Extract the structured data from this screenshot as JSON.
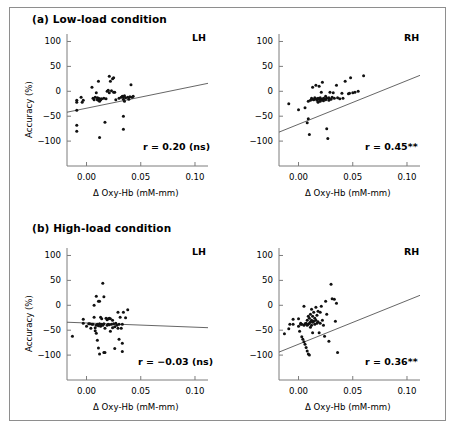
{
  "figure": {
    "background": "#ffffff",
    "border_color": "#8e8e8e",
    "panels": [
      {
        "key": "a",
        "title": "(a) Low-load condition",
        "subplots": [
          {
            "key": "a-lh",
            "hemisphere": "LH",
            "r_label": "r = 0.20 (ns)"
          },
          {
            "key": "a-rh",
            "hemisphere": "RH",
            "r_label": "r = 0.45**"
          }
        ]
      },
      {
        "key": "b",
        "title": "(b) High-load condition",
        "subplots": [
          {
            "key": "b-lh",
            "hemisphere": "LH",
            "r_label": "r = −0.03 (ns)"
          },
          {
            "key": "b-rh",
            "hemisphere": "RH",
            "r_label": "r = 0.36**"
          }
        ]
      }
    ]
  },
  "axes": {
    "xlabel": "Δ Oxy-Hb (mM-mm)",
    "ylabel": "Accuracy (%)",
    "xticks": [
      "0.00",
      "0.05",
      "0.10"
    ],
    "xtick_values": [
      0.0,
      0.05,
      0.1
    ],
    "yticks": [
      "100",
      "50",
      "0",
      "−50",
      "−100"
    ],
    "ytick_values": [
      100,
      50,
      0,
      -50,
      -100
    ],
    "xlim": [
      -0.018,
      0.112
    ],
    "ylim": [
      -150,
      115
    ],
    "marker_color": "#111111",
    "line_color": "#555555",
    "axis_color": "#7d7d7d"
  },
  "chart_data": [
    {
      "type": "scatter",
      "id": "a-lh",
      "title": "(a) Low-load condition — LH",
      "xlabel": "Δ Oxy-Hb (mM-mm)",
      "ylabel": "Accuracy (%)",
      "xlim": [
        -0.018,
        0.112
      ],
      "ylim": [
        -150,
        115
      ],
      "grid": false,
      "annotation": "r = 0.20 (ns)",
      "correlation": 0.2,
      "significance": "ns",
      "fit_line": {
        "x": [
          -0.018,
          0.112
        ],
        "y": [
          -42,
          16
        ]
      },
      "points": [
        [
          -0.009,
          -22
        ],
        [
          -0.009,
          -18
        ],
        [
          -0.009,
          -38
        ],
        [
          -0.009,
          -68
        ],
        [
          -0.009,
          -80
        ],
        [
          -0.005,
          -12
        ],
        [
          -0.004,
          -22
        ],
        [
          -0.003,
          -18
        ],
        [
          0.005,
          8
        ],
        [
          0.006,
          -14
        ],
        [
          0.007,
          -17
        ],
        [
          0.008,
          -12
        ],
        [
          0.009,
          -3
        ],
        [
          0.01,
          -13
        ],
        [
          0.01,
          -17
        ],
        [
          0.011,
          -14
        ],
        [
          0.011,
          -18
        ],
        [
          0.012,
          -15
        ],
        [
          0.012,
          -20
        ],
        [
          0.013,
          -16
        ],
        [
          0.011,
          20
        ],
        [
          0.012,
          -93
        ],
        [
          0.013,
          -17
        ],
        [
          0.014,
          -15
        ],
        [
          0.016,
          -14
        ],
        [
          0.017,
          -62
        ],
        [
          0.018,
          -15
        ],
        [
          0.019,
          0
        ],
        [
          0.02,
          2
        ],
        [
          0.021,
          30
        ],
        [
          0.021,
          -3
        ],
        [
          0.022,
          20
        ],
        [
          0.023,
          1
        ],
        [
          0.024,
          25
        ],
        [
          0.025,
          -2
        ],
        [
          0.025,
          27
        ],
        [
          0.026,
          -2
        ],
        [
          0.027,
          -17
        ],
        [
          0.03,
          -14
        ],
        [
          0.032,
          -12
        ],
        [
          0.033,
          -10
        ],
        [
          0.034,
          -11
        ],
        [
          0.034,
          -16
        ],
        [
          0.034,
          -50
        ],
        [
          0.034,
          -76
        ],
        [
          0.035,
          -9
        ],
        [
          0.035,
          -20
        ],
        [
          0.036,
          -13
        ],
        [
          0.038,
          -12
        ],
        [
          0.039,
          -16
        ],
        [
          0.04,
          -11
        ],
        [
          0.041,
          13
        ],
        [
          0.042,
          -12
        ],
        [
          0.043,
          -10
        ]
      ]
    },
    {
      "type": "scatter",
      "id": "a-rh",
      "title": "(a) Low-load condition — RH",
      "xlabel": "Δ Oxy-Hb (mM-mm)",
      "ylabel": "Accuracy (%)",
      "xlim": [
        -0.018,
        0.112
      ],
      "ylim": [
        -150,
        115
      ],
      "grid": false,
      "annotation": "r = 0.45**",
      "correlation": 0.45,
      "significance": "**",
      "fit_line": {
        "x": [
          -0.018,
          0.112
        ],
        "y": [
          -82,
          32
        ]
      },
      "points": [
        [
          -0.009,
          -25
        ],
        [
          0.0,
          -37
        ],
        [
          0.006,
          -33
        ],
        [
          0.008,
          -63
        ],
        [
          0.009,
          -55
        ],
        [
          0.009,
          -20
        ],
        [
          0.01,
          -87
        ],
        [
          0.011,
          -18
        ],
        [
          0.012,
          -14
        ],
        [
          0.013,
          8
        ],
        [
          0.013,
          -16
        ],
        [
          0.014,
          -17
        ],
        [
          0.015,
          -13
        ],
        [
          0.016,
          -15
        ],
        [
          0.016,
          12
        ],
        [
          0.017,
          -18
        ],
        [
          0.018,
          -14
        ],
        [
          0.018,
          -22
        ],
        [
          0.019,
          -16
        ],
        [
          0.019,
          10
        ],
        [
          0.02,
          -13
        ],
        [
          0.02,
          -20
        ],
        [
          0.021,
          -16
        ],
        [
          0.021,
          -2
        ],
        [
          0.022,
          -17
        ],
        [
          0.022,
          18
        ],
        [
          0.023,
          -14
        ],
        [
          0.023,
          -19
        ],
        [
          0.024,
          -15
        ],
        [
          0.025,
          -10
        ],
        [
          0.025,
          -17
        ],
        [
          0.026,
          -75
        ],
        [
          0.026,
          -14
        ],
        [
          0.027,
          -95
        ],
        [
          0.028,
          -13
        ],
        [
          0.028,
          -18
        ],
        [
          0.029,
          -2
        ],
        [
          0.03,
          -16
        ],
        [
          0.031,
          -12
        ],
        [
          0.032,
          -3
        ],
        [
          0.033,
          -14
        ],
        [
          0.035,
          12
        ],
        [
          0.036,
          -13
        ],
        [
          0.038,
          -15
        ],
        [
          0.04,
          -4
        ],
        [
          0.041,
          -14
        ],
        [
          0.043,
          20
        ],
        [
          0.046,
          -5
        ],
        [
          0.047,
          -4
        ],
        [
          0.048,
          27
        ],
        [
          0.05,
          -3
        ],
        [
          0.052,
          -2
        ],
        [
          0.055,
          0
        ],
        [
          0.06,
          31
        ]
      ]
    },
    {
      "type": "scatter",
      "id": "b-lh",
      "title": "(b) High-load condition — LH",
      "xlabel": "Δ Oxy-Hb (mM-mm)",
      "ylabel": "Accuracy (%)",
      "xlim": [
        -0.018,
        0.112
      ],
      "ylim": [
        -150,
        115
      ],
      "grid": false,
      "annotation": "r = −0.03 (ns)",
      "correlation": -0.03,
      "significance": "ns",
      "fit_line": {
        "x": [
          -0.018,
          0.112
        ],
        "y": [
          -34,
          -45
        ]
      },
      "points": [
        [
          -0.013,
          -62
        ],
        [
          -0.003,
          -36
        ],
        [
          -0.003,
          -28
        ],
        [
          0.0,
          -42
        ],
        [
          0.002,
          -37
        ],
        [
          0.003,
          -37
        ],
        [
          0.004,
          -46
        ],
        [
          0.005,
          -38
        ],
        [
          0.006,
          -38
        ],
        [
          0.007,
          -24
        ],
        [
          0.007,
          0
        ],
        [
          0.008,
          -45
        ],
        [
          0.008,
          -51
        ],
        [
          0.009,
          18
        ],
        [
          0.009,
          -40
        ],
        [
          0.009,
          -56
        ],
        [
          0.01,
          -38
        ],
        [
          0.01,
          -70
        ],
        [
          0.011,
          8
        ],
        [
          0.011,
          -41
        ],
        [
          0.011,
          -86
        ],
        [
          0.012,
          8
        ],
        [
          0.012,
          -37
        ],
        [
          0.012,
          -98
        ],
        [
          0.013,
          -24
        ],
        [
          0.013,
          -42
        ],
        [
          0.014,
          -27
        ],
        [
          0.014,
          -38
        ],
        [
          0.015,
          44
        ],
        [
          0.015,
          -40
        ],
        [
          0.016,
          17
        ],
        [
          0.016,
          -37
        ],
        [
          0.016,
          -95
        ],
        [
          0.017,
          -46
        ],
        [
          0.017,
          -95
        ],
        [
          0.018,
          -26
        ],
        [
          0.019,
          -29
        ],
        [
          0.019,
          -40
        ],
        [
          0.02,
          -27
        ],
        [
          0.02,
          -38
        ],
        [
          0.021,
          -26
        ],
        [
          0.021,
          -39
        ],
        [
          0.022,
          -27
        ],
        [
          0.022,
          -52
        ],
        [
          0.023,
          -38
        ],
        [
          0.024,
          -30
        ],
        [
          0.024,
          -45
        ],
        [
          0.025,
          -37
        ],
        [
          0.026,
          -43
        ],
        [
          0.026,
          -87
        ],
        [
          0.027,
          -36
        ],
        [
          0.028,
          -40
        ],
        [
          0.029,
          -14
        ],
        [
          0.029,
          -46
        ],
        [
          0.03,
          -38
        ],
        [
          0.03,
          -68
        ],
        [
          0.031,
          -24
        ],
        [
          0.032,
          -46
        ],
        [
          0.033,
          -38
        ],
        [
          0.033,
          -76
        ],
        [
          0.033,
          -93
        ],
        [
          0.034,
          -14
        ],
        [
          0.036,
          -25
        ],
        [
          0.038,
          -9
        ]
      ]
    },
    {
      "type": "scatter",
      "id": "b-rh",
      "title": "(b) High-load condition — RH",
      "xlabel": "Δ Oxy-Hb (mM-mm)",
      "ylabel": "Accuracy (%)",
      "xlim": [
        -0.018,
        0.112
      ],
      "ylim": [
        -150,
        115
      ],
      "grid": false,
      "annotation": "r = 0.36**",
      "correlation": 0.36,
      "significance": "**",
      "fit_line": {
        "x": [
          -0.018,
          0.112
        ],
        "y": [
          -94,
          20
        ]
      },
      "points": [
        [
          -0.013,
          -57
        ],
        [
          -0.009,
          -47
        ],
        [
          -0.008,
          -38
        ],
        [
          -0.005,
          -38
        ],
        [
          -0.005,
          -28
        ],
        [
          0.0,
          -27
        ],
        [
          0.0,
          -42
        ],
        [
          0.001,
          -52
        ],
        [
          0.002,
          -38
        ],
        [
          0.002,
          -36
        ],
        [
          0.003,
          -63
        ],
        [
          0.003,
          -38
        ],
        [
          0.004,
          -68
        ],
        [
          0.005,
          -2
        ],
        [
          0.005,
          -40
        ],
        [
          0.005,
          -73
        ],
        [
          0.006,
          -37
        ],
        [
          0.006,
          -78
        ],
        [
          0.007,
          -36
        ],
        [
          0.007,
          -85
        ],
        [
          0.008,
          -30
        ],
        [
          0.008,
          -40
        ],
        [
          0.008,
          -92
        ],
        [
          0.009,
          -22
        ],
        [
          0.009,
          -38
        ],
        [
          0.009,
          -98
        ],
        [
          0.01,
          -26
        ],
        [
          0.01,
          -36
        ],
        [
          0.01,
          -100
        ],
        [
          0.011,
          -18
        ],
        [
          0.011,
          -33
        ],
        [
          0.011,
          -44
        ],
        [
          0.012,
          -8
        ],
        [
          0.012,
          -30
        ],
        [
          0.012,
          -40
        ],
        [
          0.013,
          -22
        ],
        [
          0.013,
          -34
        ],
        [
          0.013,
          -55
        ],
        [
          0.014,
          -14
        ],
        [
          0.014,
          -32
        ],
        [
          0.015,
          -26
        ],
        [
          0.015,
          -38
        ],
        [
          0.016,
          -4
        ],
        [
          0.016,
          -30
        ],
        [
          0.017,
          -20
        ],
        [
          0.017,
          -36
        ],
        [
          0.018,
          -12
        ],
        [
          0.018,
          -33
        ],
        [
          0.019,
          -55
        ],
        [
          0.02,
          -14
        ],
        [
          0.02,
          -36
        ],
        [
          0.021,
          -2
        ],
        [
          0.022,
          -30
        ],
        [
          0.023,
          -40
        ],
        [
          0.024,
          -62
        ],
        [
          0.025,
          8
        ],
        [
          0.026,
          -18
        ],
        [
          0.028,
          -72
        ],
        [
          0.03,
          42
        ],
        [
          0.031,
          13
        ],
        [
          0.033,
          12
        ],
        [
          0.034,
          -32
        ],
        [
          0.035,
          4
        ],
        [
          0.036,
          -95
        ]
      ]
    }
  ]
}
